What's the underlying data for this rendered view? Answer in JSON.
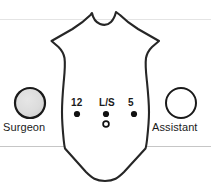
{
  "diagram": {
    "background_color": "#ffffff",
    "outline_color": "#262626",
    "horizon_line_color": "#c8c8c8",
    "body_outline_name": "patient-torso-outline"
  },
  "roles": {
    "surgeon": {
      "label": "Surgeon",
      "marker": "filled-circle",
      "fill_color": "#d9d9d9",
      "stroke_color": "#1a1a1a",
      "cx": 30,
      "cy": 103,
      "r": 15
    },
    "assistant": {
      "label": "Assistant",
      "marker": "open-circle",
      "fill_color": "#ffffff",
      "stroke_color": "#1a1a1a",
      "cx": 181,
      "cy": 103,
      "r": 15
    }
  },
  "ports": [
    {
      "label": "12",
      "description": "12 mm trocar",
      "marker": "filled-dot",
      "cx": 77,
      "cy": 114,
      "r": 3.1,
      "color": "#111111"
    },
    {
      "label": "L/S",
      "description": "Laparoscope port",
      "marker": "filled-dot",
      "cx": 106,
      "cy": 114,
      "r": 3.1,
      "color": "#111111"
    },
    {
      "label": "5",
      "description": "5 mm trocar",
      "marker": "filled-dot",
      "cx": 134,
      "cy": 114,
      "r": 3.1,
      "color": "#111111"
    }
  ],
  "umbilicus": {
    "label": "",
    "description": "open circle marker below laparoscope port",
    "marker": "open-dot",
    "cx": 106,
    "cy": 124,
    "r": 2.9,
    "stroke_color": "#111111",
    "fill_color": "#ffffff"
  },
  "guide_lines": [
    {
      "name": "upper-horizon",
      "y": 19,
      "color": "#e2e2e2"
    },
    {
      "name": "lower-horizon",
      "y": 146,
      "color": "#c4c4c4"
    }
  ]
}
